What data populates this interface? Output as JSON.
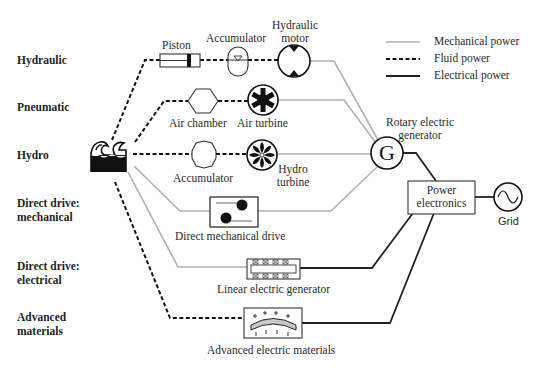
{
  "diagram": {
    "categories": [
      {
        "id": "hydraulic",
        "label": "Hydraulic"
      },
      {
        "id": "pneumatic",
        "label": "Pneumatic"
      },
      {
        "id": "hydro",
        "label": "Hydro"
      },
      {
        "id": "direct-mech",
        "label_line1": "Direct drive:",
        "label_line2": "mechanical"
      },
      {
        "id": "direct-elec",
        "label_line1": "Direct drive:",
        "label_line2": "electrical"
      },
      {
        "id": "advanced",
        "label_line1": "Advanced",
        "label_line2": "materials"
      }
    ],
    "components": {
      "piston": "Piston",
      "accumulator_hydraulic": "Accumulator",
      "hydraulic_motor_line1": "Hydraulic",
      "hydraulic_motor_line2": "motor",
      "air_chamber": "Air chamber",
      "air_turbine": "Air turbine",
      "accumulator_hydro": "Accumulator",
      "hydro_turbine_line1": "Hydro",
      "hydro_turbine_line2": "turbine",
      "direct_mechanical_drive": "Direct mechanical drive",
      "linear_electric_generator": "Linear electric generator",
      "advanced_electric_materials": "Advanced electric materials",
      "rotary_generator_line1": "Rotary electric",
      "rotary_generator_line2": "generator",
      "generator_symbol": "G",
      "power_electronics_line1": "Power",
      "power_electronics_line2": "electronics",
      "grid": "Grid"
    },
    "legend": [
      {
        "label": "Mechanical power",
        "style": "solid",
        "color": "#b0b0b0"
      },
      {
        "label": "Fluid power",
        "style": "dashed",
        "color": "#111111"
      },
      {
        "label": "Electrical power",
        "style": "solid",
        "color": "#222222"
      }
    ],
    "colors": {
      "mechanical": "#b0b0b0",
      "fluid": "#111111",
      "electrical": "#222222",
      "material_fill": "#c8c8c8"
    }
  }
}
